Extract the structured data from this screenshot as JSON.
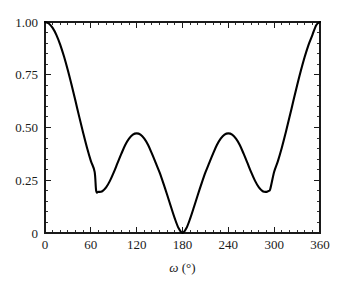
{
  "chart_data": {
    "type": "line",
    "title": "",
    "xlabel": "ω (°)",
    "xlabel_symbol": "ω",
    "xlabel_unit": "(°)",
    "ylabel": "",
    "xlim": [
      0,
      360
    ],
    "ylim": [
      0,
      1.0
    ],
    "grid": false,
    "legend": "none",
    "x_ticks": [
      0,
      60,
      120,
      180,
      240,
      300,
      360
    ],
    "x_tick_labels": [
      "0",
      "60",
      "120",
      "180",
      "240",
      "300",
      "360"
    ],
    "x_minor_tick_step": 10,
    "y_ticks": [
      0,
      0.25,
      0.5,
      0.75,
      1.0
    ],
    "y_tick_labels": [
      "0",
      "0.25",
      "0.50",
      "0.75",
      "1.00"
    ],
    "y_minor_tick_step": 0.05,
    "tick_direction": "in",
    "series": [
      {
        "name": "curve",
        "color": "#000000",
        "x": [
          0,
          5,
          10,
          15,
          20,
          25,
          30,
          35,
          40,
          45,
          50,
          55,
          60,
          65,
          67,
          70,
          75,
          80,
          85,
          90,
          95,
          100,
          105,
          110,
          115,
          120,
          125,
          130,
          135,
          140,
          145,
          150,
          155,
          160,
          165,
          170,
          175,
          180,
          185,
          190,
          195,
          200,
          205,
          210,
          215,
          220,
          225,
          230,
          235,
          240,
          245,
          250,
          255,
          260,
          265,
          270,
          275,
          280,
          285,
          290,
          293,
          295,
          300,
          305,
          310,
          315,
          320,
          325,
          330,
          335,
          340,
          345,
          350,
          355,
          360
        ],
        "y": [
          1.0,
          0.993,
          0.972,
          0.938,
          0.892,
          0.835,
          0.77,
          0.699,
          0.624,
          0.548,
          0.474,
          0.404,
          0.342,
          0.29,
          0.2,
          0.195,
          0.198,
          0.216,
          0.247,
          0.287,
          0.332,
          0.376,
          0.417,
          0.447,
          0.466,
          0.472,
          0.466,
          0.447,
          0.417,
          0.376,
          0.332,
          0.287,
          0.235,
          0.18,
          0.123,
          0.068,
          0.022,
          0.0,
          0.022,
          0.068,
          0.123,
          0.18,
          0.235,
          0.287,
          0.332,
          0.376,
          0.417,
          0.447,
          0.466,
          0.472,
          0.466,
          0.447,
          0.417,
          0.376,
          0.332,
          0.287,
          0.247,
          0.216,
          0.198,
          0.195,
          0.2,
          0.21,
          0.29,
          0.342,
          0.404,
          0.474,
          0.548,
          0.624,
          0.699,
          0.77,
          0.835,
          0.892,
          0.938,
          0.985,
          1.0
        ]
      }
    ]
  },
  "figure": {
    "background_color": "#ffffff",
    "axis_color": "#1a1a1a",
    "curve_color": "#000000"
  }
}
